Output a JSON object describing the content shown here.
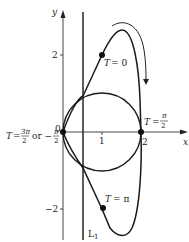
{
  "diagram": {
    "type": "parametric-curve-plot",
    "axes": {
      "x_label": "x",
      "y_label": "y",
      "origin_label": "0",
      "x_ticks": [
        "1",
        "2"
      ],
      "y_ticks": [
        "2",
        "−2"
      ]
    },
    "line": {
      "label": "L",
      "subscript": "1"
    },
    "points": [
      {
        "id": "t0",
        "label_var": "T",
        "label_eq": "= 0"
      },
      {
        "id": "tpi2",
        "label_var": "T",
        "label_eq": "=",
        "frac_num": "π",
        "frac_den": "2"
      },
      {
        "id": "tpi",
        "label_var": "T",
        "label_eq": "= π"
      },
      {
        "id": "t3pi2",
        "label_var": "T",
        "label_eq": "=",
        "frac1_num": "3π",
        "frac1_den": "2",
        "or_text": "or −",
        "frac2_num": "π",
        "frac2_den": "2"
      }
    ],
    "colors": {
      "stroke": "#1a1a1a",
      "axis": "#333333",
      "background": "#ffffff"
    }
  }
}
